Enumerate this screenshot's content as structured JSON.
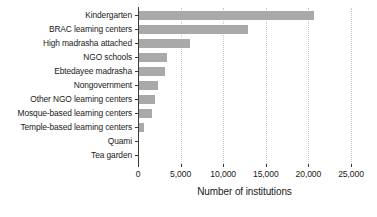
{
  "chart_data": {
    "type": "bar",
    "orientation": "horizontal",
    "title": "",
    "subtitle": "",
    "xlabel": "Number of institutions",
    "ylabel": "",
    "xlim": [
      0,
      25000
    ],
    "ylim": null,
    "grid": "vertical-dotted",
    "legend": null,
    "legend_position": "none",
    "bar_color": "#a9a9a9",
    "axis_color": "#3a3a3a",
    "gridline_color": "#c9c9c9",
    "background_color": "#ffffff",
    "categories": [
      "Kindergarten",
      "BRAC learning centers",
      "High madrasha attached",
      "NGO schools",
      "Ebtedayee madrasha",
      "Nongovernment",
      "Other NGO learning centers",
      "Mosque-based learning centers",
      "Temple-based learning centers",
      "Quami",
      "Tea garden"
    ],
    "values": [
      20700,
      12900,
      6100,
      3400,
      3200,
      2400,
      2000,
      1700,
      700,
      120,
      60
    ],
    "xticks": [
      0,
      5000,
      10000,
      15000,
      20000,
      25000
    ],
    "xticklabels": [
      "0",
      "5,000",
      "10,000",
      "15,000",
      "20,000",
      "25,000"
    ]
  }
}
